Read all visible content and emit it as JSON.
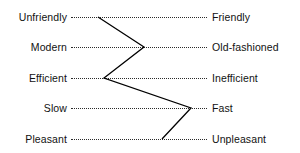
{
  "chart_data": {
    "type": "line",
    "title": "",
    "subtitle": "",
    "xlabel": "",
    "ylabel": "",
    "orientation": "horizontal-profile",
    "grid": "dotted horizontal scale lines only",
    "legend": "none",
    "axis_line_color": "#2b2b2b",
    "profile_line_color": "#000000",
    "scale_min_px": 71,
    "scale_max_px": 207,
    "categories": [
      "Unfriendly / Friendly",
      "Modern / Old-fashioned",
      "Efficient / Inefficient",
      "Slow / Fast",
      "Pleasant / Unpleasant"
    ],
    "rows": [
      {
        "index": 0,
        "left_label": "Unfriendly",
        "right_label": "Friendly",
        "row_y": 17,
        "point_x": 98,
        "position_fraction": 0.2
      },
      {
        "index": 1,
        "left_label": "Modern",
        "right_label": "Old-fashioned",
        "row_y": 47,
        "point_x": 144,
        "position_fraction": 0.54
      },
      {
        "index": 2,
        "left_label": "Efficient",
        "right_label": "Inefficient",
        "row_y": 78,
        "point_x": 104,
        "position_fraction": 0.24
      },
      {
        "index": 3,
        "left_label": "Slow",
        "right_label": "Fast",
        "row_y": 108,
        "point_x": 191,
        "position_fraction": 0.88
      },
      {
        "index": 4,
        "left_label": "Pleasant",
        "right_label": "Unpleasant",
        "row_y": 139,
        "point_x": 162,
        "position_fraction": 0.67
      }
    ],
    "values": [
      0.2,
      0.54,
      0.24,
      0.88,
      0.67
    ],
    "polyline_points": "98,17 144,47 104,78 191,108 162,139"
  }
}
